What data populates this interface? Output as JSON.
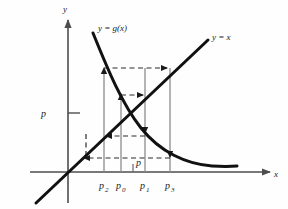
{
  "figure": {
    "type": "cobweb-diagram",
    "background": "#fefefe",
    "axes": {
      "x_label": "x",
      "y_label": "y",
      "origin": [
        68,
        172
      ],
      "x_axis_from": [
        30,
        172
      ],
      "x_axis_to": [
        276,
        172
      ],
      "y_axis_from": [
        68,
        200
      ],
      "y_axis_to": [
        68,
        16
      ],
      "axis_color": "#4d4d4d"
    },
    "curves": [
      {
        "name": "identity-line",
        "label": "y = x",
        "label_pos": [
          212,
          38
        ],
        "color": "#111111",
        "from": [
          36,
          203
        ],
        "to": [
          208,
          40
        ]
      },
      {
        "name": "g-curve",
        "label": "y = g(x)",
        "label_pos": [
          98,
          31
        ],
        "color": "#111111",
        "from": [
          93,
          33
        ],
        "to": [
          237,
          166
        ]
      }
    ],
    "y_tick": {
      "label": "p",
      "value_y": 113,
      "label_pos": [
        45,
        113
      ]
    },
    "x_ticks": [
      {
        "name": "p2",
        "label": "p",
        "sub": "2",
        "x": 104
      },
      {
        "name": "p0",
        "label": "p",
        "sub": "0",
        "x": 121
      },
      {
        "name": "p1",
        "label": "p",
        "sub": "1",
        "x": 145
      },
      {
        "name": "p3",
        "label": "p",
        "sub": "3",
        "x": 170
      }
    ],
    "fixed_point": {
      "name": "p",
      "label": "p",
      "x": 133,
      "label_pos": [
        136,
        163
      ]
    },
    "verticals": [
      {
        "name": "vline-p2",
        "x": 104,
        "y_top": 69,
        "y_bottom": 172,
        "color": "#8c8c8c",
        "arrow": "up"
      },
      {
        "name": "vline-p0",
        "x": 121,
        "y_top": 95,
        "y_bottom": 172,
        "color": "#8c8c8c",
        "arrow": "up"
      },
      {
        "name": "vline-p1",
        "x": 145,
        "y_top": 88,
        "y_bottom": 172,
        "color": "#8c8c8c",
        "arrow": "down"
      },
      {
        "name": "vline-p3",
        "x": 170,
        "y_top": 68,
        "y_bottom": 172,
        "color": "#8c8c8c",
        "arrow": "down"
      }
    ],
    "dashed_horizontals": [
      {
        "name": "dash-top",
        "y": 68,
        "x_from": 104,
        "x_to": 172,
        "dir": "right"
      },
      {
        "name": "dash-mid",
        "y": 95,
        "x_from": 121,
        "x_to": 148,
        "dir": "right"
      },
      {
        "name": "dash-lower",
        "y": 136,
        "x_from": 145,
        "x_to": 102,
        "dir": "left"
      },
      {
        "name": "dash-bottom",
        "y": 158,
        "x_from": 170,
        "x_to": 86,
        "dir": "left"
      }
    ],
    "dashed_verticals": [
      {
        "name": "dash-vline-p4",
        "x": 86,
        "y_top": 136,
        "y_bottom": 158
      }
    ],
    "colors": {
      "ink": "#111111",
      "axis": "#4d4d4d",
      "guide": "#8c8c8c",
      "dash": "#2b2b2b",
      "page": "#fefefe"
    }
  }
}
